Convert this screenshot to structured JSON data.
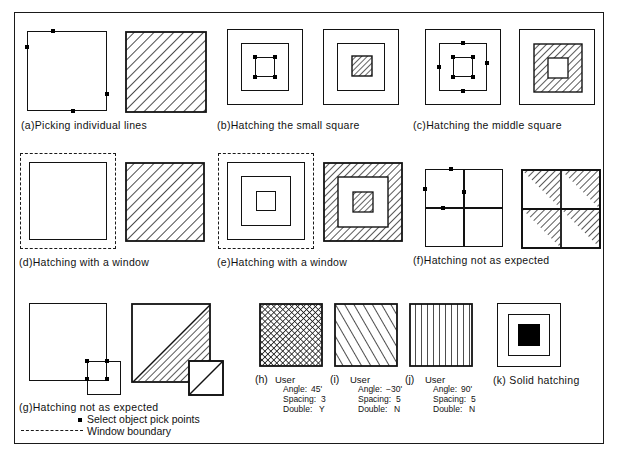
{
  "figure": {
    "frame_color": "#1a1a1a",
    "background": "#ffffff"
  },
  "panels": [
    {
      "id": "a",
      "caption": "(a)Picking individual lines"
    },
    {
      "id": "b",
      "caption": "(b)Hatching the small square"
    },
    {
      "id": "c",
      "caption": "(c)Hatching the middle square"
    },
    {
      "id": "d",
      "caption": "(d)Hatching with a window"
    },
    {
      "id": "e",
      "caption": "(e)Hatching with a window"
    },
    {
      "id": "f",
      "caption": "(f)Hatching not as expected"
    },
    {
      "id": "g",
      "caption": "(g)Hatching not as expected"
    }
  ],
  "legend": {
    "pick_points_label": "Select object pick points",
    "window_boundary_label": "Window boundary"
  },
  "user_patterns": [
    {
      "index": "(h)",
      "head": "User",
      "angle_label": "Angle:",
      "angle_value": "45'",
      "spacing_label": "Spacing:",
      "spacing_value": "3",
      "double_label": "Double:",
      "double_value": "Y"
    },
    {
      "index": "(i)",
      "head": "User",
      "angle_label": "Angle:",
      "angle_value": "−30'",
      "spacing_label": "Spacing:",
      "spacing_value": "5",
      "double_label": "Double:",
      "double_value": "N"
    },
    {
      "index": "(j)",
      "head": "User",
      "angle_label": "Angle:",
      "angle_value": "90'",
      "spacing_label": "Spacing:",
      "spacing_value": "5",
      "double_label": "Double:",
      "double_value": "N"
    }
  ],
  "solid": {
    "caption": "(k) Solid hatching"
  },
  "colors": {
    "line": "#121212",
    "hatch": "#111111",
    "fill": "#000000"
  }
}
